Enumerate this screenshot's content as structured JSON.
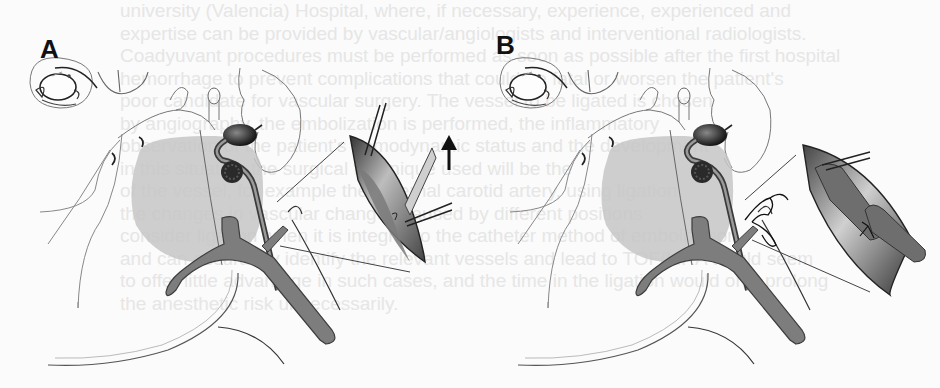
{
  "figure": {
    "panels": [
      {
        "label": "A",
        "description": "Surgical exposure of vessel in neck with inset showing incision and retraction; arrow indicates direction",
        "arrow": "up-arrow"
      },
      {
        "label": "B",
        "description": "Vessel ligated with suture tie; inset shows ligated vessel segment",
        "arrow": null
      }
    ],
    "colors": {
      "background": "#fbfbfb",
      "line": "#555555",
      "shade_light": "#c8c8c8",
      "vessel": "#7a7a7a",
      "dark": "#2a2a2a"
    }
  },
  "bleed_through_text": [
    "university (Valencia) Hospital, where, if necessary, experience, experienced and",
    "expertise can be provided by vascular/angiologists and interventional radiologists.",
    "Coadyuvant procedures must be performed as soon as possible after the first hospital",
    "hemorrhage to prevent complications that could be fatal or worsen the patient's",
    "poor candidate for vascular surgery. The vessel to be ligated is chosen",
    "by angiography, the embolization is performed, the inflammatory",
    "observation of the patient's hemodynamic status and the development",
    "in this situation the surgical technique used will be the",
    "of the vessel, for example the external carotid artery, using ligation",
    "the changes in vascular changes caused by different positions",
    "consider ligation when it is integral to the catheter method of embolization",
    "and can accurately identify the relevant vessels and lead to TOF/MRA would seem",
    "to offer little advantage in such cases, and the time in the ligation would only prolong",
    "the anesthetic risk unnecessarily."
  ]
}
